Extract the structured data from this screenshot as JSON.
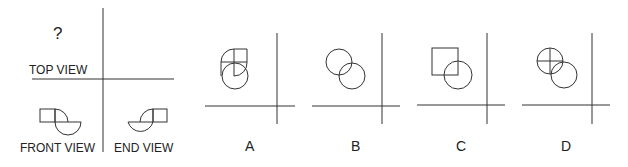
{
  "puzzle": {
    "question_mark": "?",
    "views": {
      "top": "TOP VIEW",
      "front": "FRONT VIEW",
      "end": "END VIEW"
    },
    "options": [
      {
        "id": "A",
        "label": "A"
      },
      {
        "id": "B",
        "label": "B"
      },
      {
        "id": "C",
        "label": "C"
      },
      {
        "id": "D",
        "label": "D"
      }
    ]
  },
  "colors": {
    "line": "#333333",
    "background": "#ffffff"
  }
}
